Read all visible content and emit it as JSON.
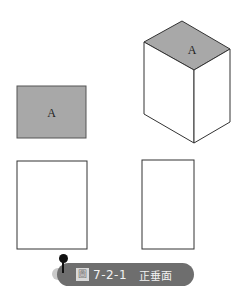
{
  "figure": {
    "top_view_label": "A",
    "iso_top_label": "A",
    "face_fill": "#a8a8a8",
    "stroke": "#333333"
  },
  "caption": {
    "prefix_icon": "figure-icon",
    "prefix_char": "圖",
    "number": "7-2-1",
    "title": "正垂面",
    "background": "#6e6e6e"
  }
}
